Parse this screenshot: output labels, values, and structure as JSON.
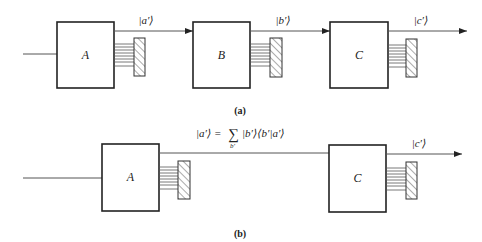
{
  "colors": {
    "stroke": "#222222",
    "line": "#555555",
    "background": "#ffffff"
  },
  "panel_a": {
    "caption": "(a)",
    "boxes": [
      {
        "label": "A",
        "x": 57,
        "y": 22,
        "w": 57,
        "h": 66
      },
      {
        "label": "B",
        "x": 193,
        "y": 22,
        "w": 57,
        "h": 66
      },
      {
        "label": "C",
        "x": 330,
        "y": 22,
        "w": 58,
        "h": 66
      }
    ],
    "state_labels": [
      "|a′⟩",
      "|b′⟩",
      "|c′⟩"
    ]
  },
  "panel_b": {
    "caption": "(b)",
    "boxes": [
      {
        "label": "A",
        "x": 102,
        "y": 144,
        "w": 57,
        "h": 67
      },
      {
        "label": "C",
        "x": 329,
        "y": 145,
        "w": 57,
        "h": 67
      }
    ],
    "formula": {
      "lhs": "|a′⟩ =",
      "sum": "∑",
      "sum_index": "b′",
      "rhs": "|b′⟩⟨b′|a′⟩"
    },
    "state_labels": [
      "|c′⟩"
    ]
  }
}
